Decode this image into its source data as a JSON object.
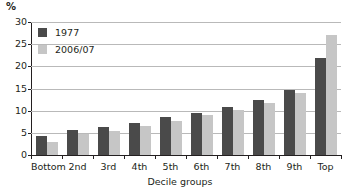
{
  "chart_data": {
    "type": "bar",
    "title": "",
    "xlabel": "Decile groups",
    "ylabel": "%",
    "ylim": [
      0,
      30
    ],
    "yticks": [
      0,
      5,
      10,
      15,
      20,
      25,
      30
    ],
    "ytick_labels": [
      "0",
      "5",
      "10",
      "15",
      "20",
      "25",
      "30"
    ],
    "grid": true,
    "legend_position": "top-left",
    "categories": [
      "Bottom",
      "2nd",
      "3rd",
      "4th",
      "5th",
      "6th",
      "7th",
      "8th",
      "9th",
      "Top"
    ],
    "series": [
      {
        "name": "1977",
        "color": "#4a4a4a",
        "values": [
          4.3,
          5.6,
          6.3,
          7.3,
          8.5,
          9.5,
          10.8,
          12.3,
          14.6,
          21.8
        ]
      },
      {
        "name": "2006/07",
        "color": "#c6c6c6",
        "values": [
          3.0,
          4.8,
          5.5,
          6.6,
          7.6,
          9.0,
          10.2,
          11.8,
          14.0,
          27.0
        ]
      }
    ]
  },
  "legend": {
    "items": [
      {
        "label": "1977",
        "color": "#4a4a4a"
      },
      {
        "label": "2006/07",
        "color": "#c6c6c6"
      }
    ]
  },
  "axes": {
    "y_unit": "%",
    "x_title": "Decile groups"
  },
  "colors": {
    "series_1977": "#4a4a4a",
    "series_2006_07": "#c6c6c6",
    "axis": "#231f20",
    "gridline": "#b9b9b9",
    "background": "#ffffff"
  }
}
